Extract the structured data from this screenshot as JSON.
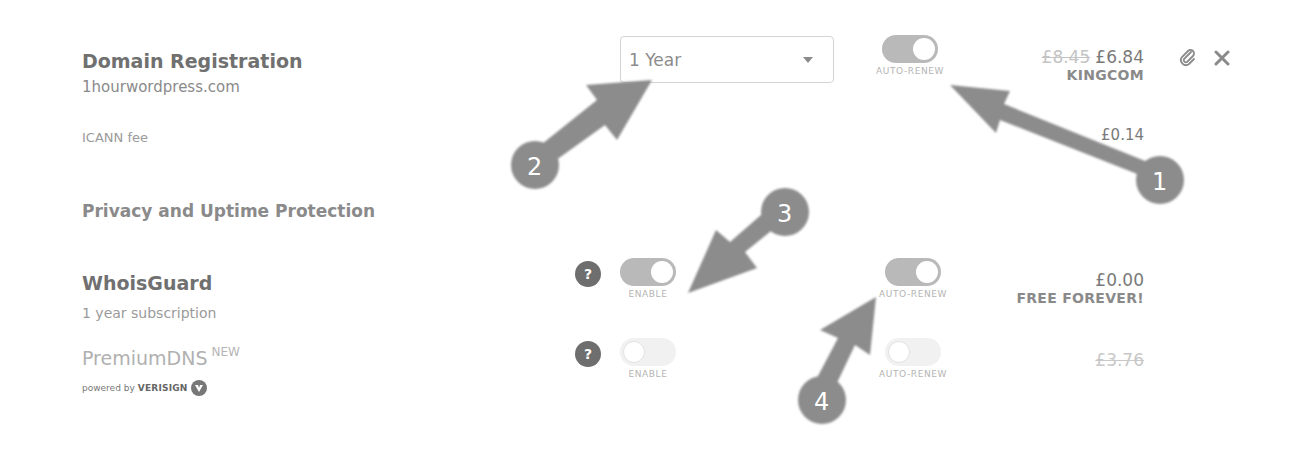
{
  "domain_registration": {
    "title": "Domain Registration",
    "domain": "1hourwordpress.com",
    "icann_label": "ICANN fee",
    "period_select": {
      "value": "1 Year"
    },
    "auto_renew": {
      "label": "AUTO-RENEW",
      "state": "on"
    },
    "price_old": "£8.45",
    "price": "£6.84",
    "promo_code": "KINGCOM",
    "icann_price": "£0.14"
  },
  "privacy_section": {
    "title": "Privacy and Uptime Protection"
  },
  "whoisguard": {
    "title": "WhoisGuard",
    "subtitle": "1 year subscription",
    "help": "?",
    "enable": {
      "label": "ENABLE",
      "state": "on"
    },
    "auto_renew": {
      "label": "AUTO-RENEW",
      "state": "on"
    },
    "price": "£0.00",
    "promo": "FREE FOREVER!"
  },
  "premiumdns": {
    "title": "PremiumDNS",
    "badge": "NEW",
    "powered_by": "powered by",
    "brand": "VERISIGN",
    "help": "?",
    "enable": {
      "label": "ENABLE",
      "state": "off"
    },
    "auto_renew": {
      "label": "AUTO-RENEW",
      "state": "off"
    },
    "price": "£3.76"
  },
  "annotations": [
    {
      "number": "1"
    },
    {
      "number": "2"
    },
    {
      "number": "3"
    },
    {
      "number": "4"
    }
  ],
  "colors": {
    "arrow": "#8c8c8c",
    "toggle_on": "#b9b9b9",
    "help_badge": "#6e6e6e"
  }
}
